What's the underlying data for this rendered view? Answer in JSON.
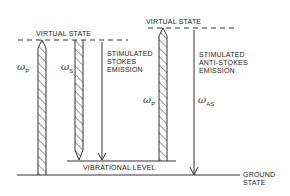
{
  "diagram": {
    "levels": {
      "virtual_state_left": "VIRTUAL  STATE",
      "virtual_state_right": "VIRTUAL  STATE",
      "vibrational_level": "VIBRATIONAL  LEVEL",
      "ground_state_line1": "GROUND",
      "ground_state_line2": "STATE"
    },
    "processes": {
      "stokes_line1": "STIMULATED",
      "stokes_line2": "STOKES",
      "stokes_line3": "EMISSION",
      "antistokes_line1": "STIMULATED",
      "antistokes_line2": "ANTI-STOKES",
      "antistokes_line3": "EMISSION"
    },
    "symbols": {
      "omega": "ω",
      "pump_sub": "P",
      "stokes_sub": "S",
      "antistokes_sub": "AS"
    }
  }
}
